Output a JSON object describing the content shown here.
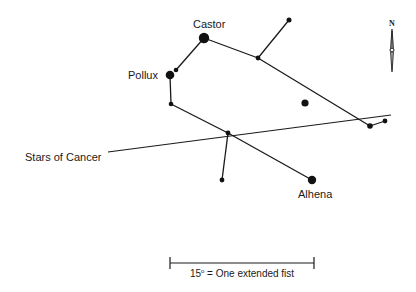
{
  "diagram": {
    "labels": {
      "castor": "Castor",
      "pollux": "Pollux",
      "alhena": "Alhena",
      "cancer": "Stars of Cancer"
    },
    "scale_bar": {
      "degrees": "15",
      "text": "15° = One extended fist",
      "text_rest": " = One extended fist"
    },
    "compass": {
      "north_label": "N"
    },
    "colors": {
      "ink": "#1a1a1a",
      "background": "#ffffff"
    }
  }
}
